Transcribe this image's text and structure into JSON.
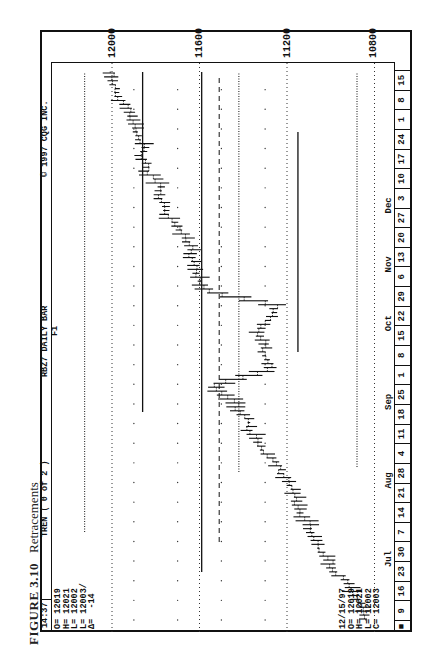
{
  "caption": {
    "figure": "FIGURE 3.10",
    "title": "Retracements"
  },
  "header": {
    "time": "14:37",
    "study": "TREN ( 0 of 2 )",
    "symbol": "RBZ7 DAILY BAR",
    "copyright": "© 1997 CQG INC."
  },
  "ohlc_top": {
    "O": "O= 12019",
    "H": "H= 12021",
    "L1": "L= 12002",
    "L2": "L= 12003/",
    "D": "Δ=  -14"
  },
  "ohlc_bottom": {
    "date": "12/15/97",
    "O": "O= 12019",
    "H": "H= 12021",
    "L": "L= 12002",
    "C": "C= 12003"
  },
  "annotation": {
    "fib_label": "F1"
  },
  "chart_data": {
    "type": "bar",
    "subtype": "ohlc-daily",
    "title": "RBZ7 DAILY BAR",
    "xlabel": "",
    "ylabel": "",
    "ylim": [
      10700,
      12150
    ],
    "price_ticks": [
      12000,
      11600,
      11200,
      10800
    ],
    "months": [
      {
        "label": "Jul",
        "at_week": 3
      },
      {
        "label": "Aug",
        "at_week": 7
      },
      {
        "label": "Sep",
        "at_week": 11
      },
      {
        "label": "Oct",
        "at_week": 15
      },
      {
        "label": "Nov",
        "at_week": 18
      },
      {
        "label": "Dec",
        "at_week": 21
      }
    ],
    "week_labels": [
      "9",
      "16",
      "23",
      "30",
      "7",
      "14",
      "21",
      "28",
      "4",
      "11",
      "18",
      "25",
      "1",
      "8",
      "15",
      "22",
      "29",
      "6",
      "13",
      "20",
      "27",
      "3",
      "10",
      "17",
      "24",
      "1",
      "8",
      "15"
    ],
    "approx_weekly_close": [
      10870,
      10930,
      11000,
      11060,
      11100,
      11160,
      11180,
      11240,
      11330,
      11380,
      11430,
      11520,
      11280,
      11300,
      11330,
      11250,
      11570,
      11620,
      11640,
      11680,
      11760,
      11790,
      11830,
      11860,
      11900,
      11920,
      11980,
      12003
    ],
    "horizontal_levels": [
      {
        "name": "retracement-line-1",
        "price": 12125,
        "style": "dotted"
      },
      {
        "name": "retracement-line-2",
        "price": 11860,
        "style": "solid"
      },
      {
        "name": "retracement-line-3",
        "price": 11590,
        "style": "solid"
      },
      {
        "name": "F1-fib-line",
        "price": 11510,
        "style": "dashed"
      },
      {
        "name": "retracement-line-4",
        "price": 11420,
        "style": "dotted"
      },
      {
        "name": "retracement-line-5",
        "price": 11150,
        "style": "solid"
      },
      {
        "name": "retracement-line-6",
        "price": 10880,
        "style": "dotted"
      }
    ],
    "last_bar": {
      "date": "12/15/97",
      "open": 12019,
      "high": 12021,
      "low": 12002,
      "close": 12003,
      "change": -14
    }
  }
}
